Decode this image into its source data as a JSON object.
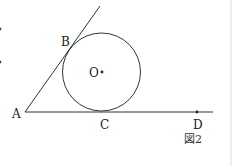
{
  "figure": {
    "caption": "図2",
    "points": {
      "A": "A",
      "B": "B",
      "C": "C",
      "D": "D",
      "O": "O"
    },
    "colors": {
      "stroke": "#333333",
      "background": "#ffffff"
    }
  }
}
